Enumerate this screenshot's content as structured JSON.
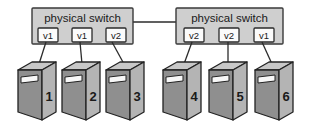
{
  "diagram": {
    "colors": {
      "switch_fill": "#cfcfcf",
      "switch_stroke": "#3a3a3a",
      "port_fill": "#fbfbfb",
      "port_stroke": "#2b2b2b",
      "link_stroke": "#2b2b2b",
      "server_front": "#8f8f8f",
      "server_side": "#b4b4b4",
      "server_top": "#c8c8c8",
      "server_stroke": "#232323",
      "slot_fill": "#f7f7f7",
      "text": "#1a1a1a",
      "background": "#ffffff"
    },
    "switches": [
      {
        "id": "switch-left",
        "label": "physical switch",
        "ports": [
          {
            "id": "port-left-1",
            "label": "v1",
            "connects_to": "server-1"
          },
          {
            "id": "port-left-2",
            "label": "v1",
            "connects_to": "server-2"
          },
          {
            "id": "port-left-3",
            "label": "v2",
            "connects_to": "server-3"
          }
        ]
      },
      {
        "id": "switch-right",
        "label": "physical switch",
        "ports": [
          {
            "id": "port-right-1",
            "label": "v2",
            "connects_to": "server-4"
          },
          {
            "id": "port-right-2",
            "label": "v2",
            "connects_to": "server-5"
          },
          {
            "id": "port-right-3",
            "label": "v1",
            "connects_to": "server-6"
          }
        ]
      }
    ],
    "trunk_link": {
      "id": "switch-interconnect",
      "from": "switch-left",
      "to": "switch-right",
      "label": ""
    },
    "servers": [
      {
        "id": "server-1",
        "label": "1"
      },
      {
        "id": "server-2",
        "label": "2"
      },
      {
        "id": "server-3",
        "label": "3"
      },
      {
        "id": "server-4",
        "label": "4"
      },
      {
        "id": "server-5",
        "label": "5"
      },
      {
        "id": "server-6",
        "label": "6"
      }
    ]
  }
}
